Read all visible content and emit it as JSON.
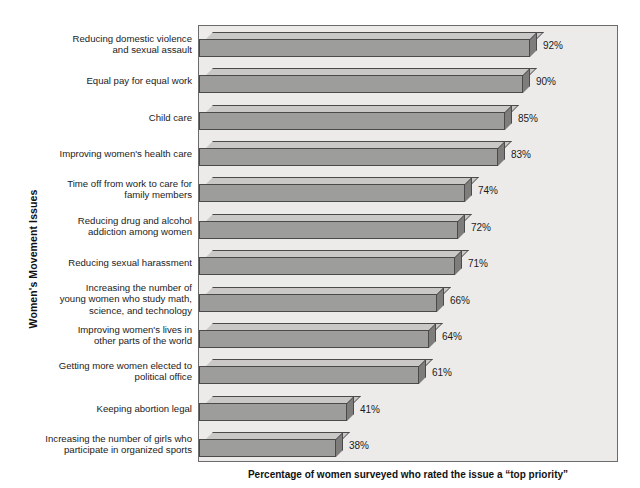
{
  "chart_data": {
    "type": "bar",
    "orientation": "horizontal",
    "style": "3d",
    "title": "",
    "xlabel": "Percentage of women surveyed who rated the issue a “top priority”",
    "ylabel": "Women's Movement Issues",
    "xlim": [
      0,
      100
    ],
    "grid": false,
    "legend": null,
    "value_suffix": "%",
    "categories": [
      "Reducing domestic violence\nand sexual assault",
      "Equal pay for equal work",
      "Child care",
      "Improving women's health care",
      "Time off from work to care for\nfamily members",
      "Reducing drug and alcohol\naddiction among women",
      "Reducing sexual harassment",
      "Increasing the number of\nyoung women who study math,\nscience, and technology",
      "Improving women's lives in\nother parts of the world",
      "Getting more women elected to\npolitical office",
      "Keeping abortion legal",
      "Increasing the number of girls who\nparticipate in organized sports"
    ],
    "values": [
      92,
      90,
      85,
      83,
      74,
      72,
      71,
      66,
      64,
      61,
      41,
      38
    ],
    "value_labels": [
      "92%",
      "90%",
      "85%",
      "83%",
      "74%",
      "72%",
      "71%",
      "66%",
      "64%",
      "61%",
      "41%",
      "38%"
    ],
    "colors": {
      "bar_front": "#9d9d9c",
      "bar_top": "#c9c8c6",
      "bar_side": "#7e7d7c",
      "bar_edge": "#4a4a4a",
      "plot_background": "#ecebe9",
      "plot_border": "#6b6b6b",
      "page_background": "#ffffff",
      "text": "#1b1b1b"
    }
  }
}
